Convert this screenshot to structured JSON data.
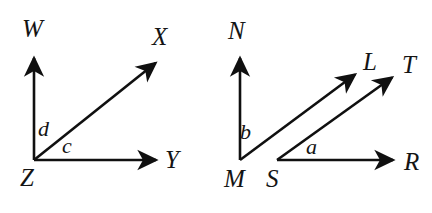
{
  "figure": {
    "background_color": "#ffffff",
    "stroke_color": "#101010",
    "text_color": "#141414",
    "diagrams": [
      {
        "name": "left-angle-figure",
        "vertices": [
          {
            "id": "Z",
            "label": "Z",
            "x": 34,
            "y": 160,
            "label_x": 20,
            "label_y": 186
          }
        ],
        "rays": [
          {
            "id": "ZW",
            "from": "Z",
            "to_label": "W",
            "x1": 34,
            "y1": 160,
            "x2": 34,
            "y2": 56,
            "label_x": 22,
            "label_y": 37
          },
          {
            "id": "ZX",
            "from": "Z",
            "to_label": "X",
            "x1": 34,
            "y1": 160,
            "x2": 158,
            "y2": 61,
            "label_x": 152,
            "label_y": 45
          },
          {
            "id": "ZY",
            "from": "Z",
            "to_label": "Y",
            "x1": 34,
            "y1": 160,
            "x2": 159,
            "y2": 160,
            "label_x": 165,
            "label_y": 168
          }
        ],
        "angles": [
          {
            "id": "d",
            "label": "d",
            "label_x": 38,
            "label_y": 136,
            "between": "ZW and ZX"
          },
          {
            "id": "c",
            "label": "c",
            "label_x": 62,
            "label_y": 153,
            "between": "ZX and ZY"
          }
        ]
      },
      {
        "name": "right-angle-figure",
        "vertices": [
          {
            "id": "M",
            "label": "M",
            "x": 240,
            "y": 160,
            "label_x": 224,
            "label_y": 187
          },
          {
            "id": "S",
            "label": "S",
            "x": 277,
            "y": 160,
            "label_x": 266,
            "label_y": 187
          }
        ],
        "rays": [
          {
            "id": "MN",
            "from": "M",
            "to_label": "N",
            "x1": 240,
            "y1": 160,
            "x2": 240,
            "y2": 56,
            "label_x": 228,
            "label_y": 39
          },
          {
            "id": "ML",
            "from": "M",
            "to_label": "L",
            "x1": 240,
            "y1": 160,
            "x2": 358,
            "y2": 72,
            "label_x": 363,
            "label_y": 70
          },
          {
            "id": "ST",
            "from": "S",
            "to_label": "T",
            "x1": 277,
            "y1": 160,
            "x2": 395,
            "y2": 75,
            "label_x": 402,
            "label_y": 73
          },
          {
            "id": "SR",
            "from": "S",
            "to_label": "R",
            "x1": 277,
            "y1": 160,
            "x2": 396,
            "y2": 160,
            "label_x": 404,
            "label_y": 170
          }
        ],
        "angles": [
          {
            "id": "b",
            "label": "b",
            "label_x": 240,
            "label_y": 139,
            "between": "MN and ML"
          },
          {
            "id": "a",
            "label": "a",
            "label_x": 306,
            "label_y": 154,
            "between": "ST and SR"
          }
        ]
      }
    ]
  }
}
